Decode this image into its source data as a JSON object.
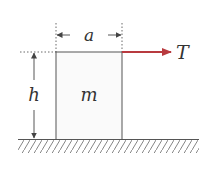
{
  "diagram": {
    "type": "physics-free-body",
    "labels": {
      "width": "a",
      "height": "h",
      "mass": "m",
      "force": "T"
    },
    "colors": {
      "line": "#555555",
      "box_fill": "#fafafa",
      "force_arrow": "#b83a3f",
      "text": "#333333",
      "hatch": "#666666"
    }
  }
}
